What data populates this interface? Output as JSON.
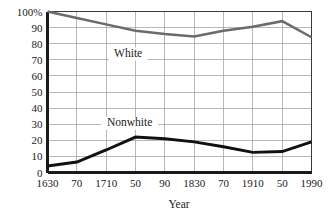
{
  "chart_data": {
    "type": "line",
    "title": "",
    "subtitle": "",
    "xlabel": "Year",
    "ylabel": "",
    "xlim": [
      1630,
      1990
    ],
    "ylim": [
      0,
      100
    ],
    "grid": true,
    "legend": "inline-annotations",
    "y_tick_labels": [
      "100%",
      "90",
      "80",
      "70",
      "60",
      "50",
      "40",
      "30",
      "20",
      "10",
      "0"
    ],
    "y_tick_values": [
      100,
      90,
      80,
      70,
      60,
      50,
      40,
      30,
      20,
      10,
      0
    ],
    "x_tick_labels": [
      "1630",
      "70",
      "1710",
      "50",
      "90",
      "1830",
      "70",
      "1910",
      "50",
      "1990"
    ],
    "x_tick_values": [
      1630,
      1670,
      1710,
      1750,
      1790,
      1830,
      1870,
      1910,
      1950,
      1990
    ],
    "x": [
      1630,
      1670,
      1710,
      1750,
      1790,
      1830,
      1870,
      1910,
      1950,
      1990
    ],
    "series": [
      {
        "name": "White",
        "color": "#6b6b6b",
        "values": [
          100,
          96,
          92,
          88,
          86,
          84.5,
          88,
          90.5,
          94,
          84
        ],
        "label_x": 1740,
        "label_y": 72
      },
      {
        "name": "Nonwhite",
        "color": "#111111",
        "values": [
          4,
          6.5,
          14,
          22,
          21,
          19,
          16,
          12.5,
          13,
          19
        ],
        "label_x": 1742,
        "label_y": 29
      }
    ],
    "annotations": [
      {
        "text": "White",
        "x": 1740,
        "y": 72
      },
      {
        "text": "Nonwhite",
        "x": 1742,
        "y": 29
      }
    ]
  },
  "axis": {
    "x_title": "Year"
  },
  "colors": {
    "white_series": "#6b6b6b",
    "nonwhite_series": "#111111",
    "gridline": "#9a9a9a",
    "frame": "#3a3a3a",
    "text": "#1a1a1a",
    "background": "#ffffff"
  }
}
